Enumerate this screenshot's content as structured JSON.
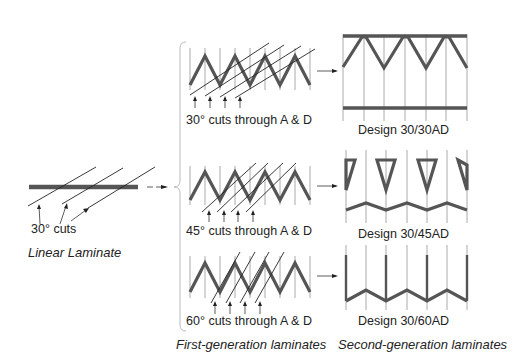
{
  "linear": {
    "cut_label": "30° cuts",
    "title": "Linear Laminate"
  },
  "first_generation": {
    "title": "First-generation laminates",
    "rows": [
      {
        "cut_label": "30° cuts through A & D",
        "angle": 30
      },
      {
        "cut_label": "45° cuts through A & D",
        "angle": 45
      },
      {
        "cut_label": "60° cuts through A & D",
        "angle": 60
      }
    ]
  },
  "second_generation": {
    "title": "Second-generation laminates",
    "designs": [
      {
        "label": "Design 30/30AD"
      },
      {
        "label": "Design 30/45AD"
      },
      {
        "label": "Design 30/60AD"
      }
    ]
  },
  "colors": {
    "laminate": "#555555",
    "grid": "#aaaaaa",
    "cut": "#222222"
  }
}
